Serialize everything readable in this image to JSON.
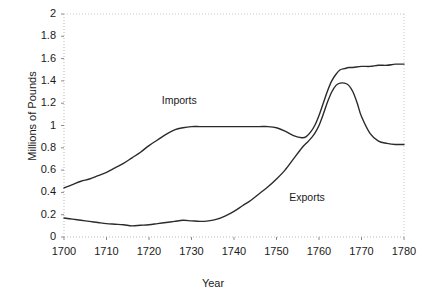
{
  "chart_data": {
    "type": "line",
    "title": "",
    "xlabel": "Year",
    "ylabel": "Millions of Pounds",
    "xlim": [
      1700,
      1780
    ],
    "ylim": [
      0,
      2
    ],
    "xticks": [
      "1700",
      "1710",
      "1720",
      "1730",
      "1740",
      "1750",
      "1760",
      "1770",
      "1780"
    ],
    "yticks": [
      "0",
      "0.2",
      "0.4",
      "0.6",
      "0.8",
      "1",
      "1.2",
      "1.4",
      "1.6",
      "1.8",
      "2"
    ],
    "grid": false,
    "legend_position": "inline-annotation",
    "line_color": "#2b2b2b",
    "axis_color": "#b9b9b9",
    "series": [
      {
        "name": "Imports",
        "label_x": 1723,
        "label_y": 1.22,
        "x": [
          1700,
          1702,
          1704,
          1706,
          1708,
          1710,
          1712,
          1714,
          1716,
          1718,
          1720,
          1722,
          1724,
          1726,
          1728,
          1730,
          1732,
          1734,
          1736,
          1738,
          1740,
          1742,
          1744,
          1746,
          1748,
          1750,
          1752,
          1754,
          1756,
          1757,
          1758,
          1759,
          1760,
          1761,
          1762,
          1763,
          1764,
          1765,
          1766,
          1767,
          1768,
          1770,
          1772,
          1774,
          1776,
          1778,
          1780
        ],
        "values": [
          0.44,
          0.47,
          0.5,
          0.52,
          0.55,
          0.58,
          0.62,
          0.66,
          0.71,
          0.76,
          0.82,
          0.87,
          0.92,
          0.96,
          0.98,
          0.99,
          0.99,
          0.99,
          0.99,
          0.99,
          0.99,
          0.99,
          0.99,
          0.99,
          0.99,
          0.98,
          0.95,
          0.91,
          0.89,
          0.9,
          0.94,
          1.0,
          1.09,
          1.2,
          1.31,
          1.4,
          1.46,
          1.5,
          1.51,
          1.52,
          1.52,
          1.53,
          1.53,
          1.54,
          1.54,
          1.55,
          1.55
        ]
      },
      {
        "name": "Exports",
        "label_x": 1753,
        "label_y": 0.35,
        "x": [
          1700,
          1702,
          1704,
          1706,
          1708,
          1710,
          1712,
          1714,
          1716,
          1718,
          1720,
          1722,
          1724,
          1726,
          1728,
          1730,
          1732,
          1734,
          1736,
          1738,
          1740,
          1742,
          1744,
          1746,
          1748,
          1750,
          1752,
          1754,
          1756,
          1757,
          1758,
          1759,
          1760,
          1761,
          1762,
          1763,
          1764,
          1765,
          1766,
          1767,
          1768,
          1769,
          1770,
          1772,
          1774,
          1776,
          1778,
          1780
        ],
        "values": [
          0.17,
          0.16,
          0.15,
          0.14,
          0.13,
          0.12,
          0.115,
          0.11,
          0.1,
          0.105,
          0.11,
          0.12,
          0.13,
          0.14,
          0.15,
          0.145,
          0.14,
          0.145,
          0.16,
          0.19,
          0.23,
          0.28,
          0.33,
          0.39,
          0.45,
          0.52,
          0.6,
          0.7,
          0.8,
          0.84,
          0.88,
          0.93,
          1.0,
          1.1,
          1.21,
          1.3,
          1.36,
          1.38,
          1.38,
          1.36,
          1.3,
          1.2,
          1.08,
          0.93,
          0.86,
          0.84,
          0.83,
          0.83
        ]
      }
    ]
  }
}
